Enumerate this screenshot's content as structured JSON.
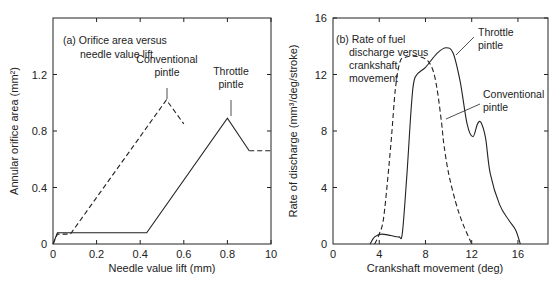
{
  "chart_data": [
    {
      "type": "line",
      "panel": "(a)",
      "title": "(a) Orifice area versus needle value lift",
      "title_lines": [
        "(a) Orifice area versus",
        "needle value lift"
      ],
      "xlabel": "Needle value lift (mm)",
      "ylabel": "Annular orifice area (mm²)",
      "xlim": [
        0,
        1.0
      ],
      "ylim": [
        0,
        1.6
      ],
      "xticks": [
        0,
        0.2,
        0.4,
        0.6,
        0.8,
        1.0
      ],
      "xtick_labels": [
        "0",
        "0.2",
        "0.4",
        "0.6",
        "0.8",
        "10"
      ],
      "yticks": [
        0,
        0.4,
        0.8,
        1.2
      ],
      "ytick_labels": [
        "0",
        "0.4",
        "0.8",
        "1.2"
      ],
      "grid": false,
      "series": [
        {
          "name": "Conventional pintle",
          "style": "dashed",
          "x": [
            0,
            0.02,
            0.08,
            0.52,
            0.6
          ],
          "y": [
            0,
            0.07,
            0.07,
            1.02,
            0.85
          ]
        },
        {
          "name": "Throttle pintle",
          "style": "solid",
          "x": [
            0,
            0.02,
            0.43,
            0.8,
            0.9
          ],
          "y": [
            0,
            0.08,
            0.08,
            0.89,
            0.66
          ]
        },
        {
          "name": "Throttle pintle (continuation)",
          "style": "dashed",
          "x": [
            0.9,
            1.0
          ],
          "y": [
            0.66,
            0.66
          ]
        }
      ],
      "annotations": [
        {
          "lines": [
            "Conventional",
            "pintle"
          ],
          "x": 0.52,
          "y": 1.02
        },
        {
          "lines": [
            "Throttle",
            "pintle"
          ],
          "x": 0.8,
          "y": 0.89
        }
      ]
    },
    {
      "type": "line",
      "panel": "(b)",
      "title": "(b) Rate of fuel discharge versus crankshaft movement",
      "title_lines": [
        "(b) Rate of fuel",
        "discharge versus",
        "crankshaft",
        "movement"
      ],
      "xlabel": "Crankshaft movement (deg)",
      "ylabel": "Rate of discharge (mm³/deg/stroke)",
      "xlim": [
        0,
        18.6
      ],
      "ylim": [
        0,
        16
      ],
      "xticks": [
        0,
        4,
        8,
        12,
        16
      ],
      "xtick_labels": [
        "0",
        "4",
        "8",
        "12",
        "16"
      ],
      "yticks": [
        0,
        4,
        8,
        12,
        16
      ],
      "ytick_labels": [
        "0",
        "4",
        "8",
        "12",
        "16"
      ],
      "grid": false,
      "series": [
        {
          "name": "Conventional pintle",
          "style": "dashed",
          "x": [
            3.6,
            4.0,
            4.4,
            5.0,
            5.4,
            5.8,
            6.2,
            7.0,
            8.0,
            8.6,
            9.0,
            9.4,
            9.6,
            10.0,
            10.6,
            11.2,
            12.0
          ],
          "y": [
            0,
            0.7,
            2.0,
            7.0,
            11.0,
            12.9,
            13.2,
            13.3,
            13.1,
            12.4,
            11.0,
            8.5,
            7.0,
            5.0,
            3.0,
            1.5,
            0
          ]
        },
        {
          "name": "Throttle pintle",
          "style": "solid",
          "x": [
            3.2,
            3.6,
            4.2,
            5.0,
            5.7,
            6.0,
            6.4,
            6.8,
            7.1,
            8.0,
            9.0,
            9.8,
            10.4,
            11.0,
            11.6,
            12.1,
            12.5,
            12.8,
            13.2,
            13.6,
            14.4,
            15.2,
            15.8,
            16.2
          ],
          "y": [
            0,
            0.5,
            0.7,
            0.6,
            0.5,
            0.8,
            5.0,
            10.0,
            11.8,
            12.5,
            13.5,
            13.9,
            13.5,
            11.5,
            8.5,
            7.6,
            8.5,
            8.6,
            7.5,
            5.0,
            2.8,
            1.7,
            1.0,
            0
          ]
        }
      ],
      "annotations": [
        {
          "lines": [
            "Throttle",
            "pintle"
          ],
          "x": 10.6,
          "y": 13.0
        },
        {
          "lines": [
            "Conventional",
            "pintle"
          ],
          "x": 9.6,
          "y": 8.8
        }
      ]
    }
  ]
}
